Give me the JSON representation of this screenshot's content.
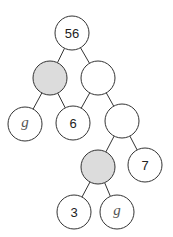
{
  "diagram": {
    "type": "binary-tree",
    "colors": {
      "stroke": "#333333",
      "filled": "#dcdcdc",
      "empty": "#ffffff"
    },
    "radius": 17,
    "nodes": [
      {
        "id": "n0",
        "x": 72,
        "y": 33,
        "label": "56",
        "shaded": false,
        "italic": false
      },
      {
        "id": "n1",
        "x": 50,
        "y": 78,
        "label": "",
        "shaded": true,
        "italic": false
      },
      {
        "id": "n2",
        "x": 98,
        "y": 78,
        "label": "",
        "shaded": false,
        "italic": false
      },
      {
        "id": "n3",
        "x": 25,
        "y": 124,
        "label": "g",
        "shaded": false,
        "italic": true
      },
      {
        "id": "n4",
        "x": 73,
        "y": 123,
        "label": "6",
        "shaded": false,
        "italic": false
      },
      {
        "id": "n5",
        "x": 122,
        "y": 121,
        "label": "",
        "shaded": false,
        "italic": false
      },
      {
        "id": "n6",
        "x": 98,
        "y": 167,
        "label": "",
        "shaded": true,
        "italic": false
      },
      {
        "id": "n7",
        "x": 145,
        "y": 165,
        "label": "7",
        "shaded": false,
        "italic": false
      },
      {
        "id": "n8",
        "x": 74,
        "y": 212,
        "label": "3",
        "shaded": false,
        "italic": false
      },
      {
        "id": "n9",
        "x": 117,
        "y": 212,
        "label": "g",
        "shaded": false,
        "italic": true
      }
    ],
    "edges": [
      [
        "n0",
        "n1"
      ],
      [
        "n0",
        "n2"
      ],
      [
        "n1",
        "n3"
      ],
      [
        "n1",
        "n4"
      ],
      [
        "n2",
        "n4"
      ],
      [
        "n2",
        "n5"
      ],
      [
        "n5",
        "n6"
      ],
      [
        "n5",
        "n7"
      ],
      [
        "n6",
        "n8"
      ],
      [
        "n6",
        "n9"
      ]
    ]
  }
}
